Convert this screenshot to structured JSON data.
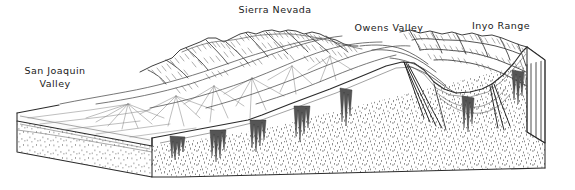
{
  "figure": {
    "type": "geologic-block-diagram",
    "width": 575,
    "height": 190
  },
  "labels": [
    {
      "id": "san-joaquin-valley",
      "name": "San Joaquin Valley",
      "line1": "San Joaquin",
      "line2": "Valley",
      "x": 17,
      "y": 65
    },
    {
      "id": "sierra-nevada",
      "name": "Sierra Nevada",
      "line1": "Sierra Nevada",
      "line2": "",
      "x": 224,
      "y": 4
    },
    {
      "id": "owens-valley",
      "name": "Owens Valley",
      "line1": "Owens Valley",
      "line2": "",
      "x": 353,
      "y": 22
    },
    {
      "id": "inyo-range",
      "name": "Inyo Range",
      "line1": "Inyo  Range",
      "line2": "",
      "x": 466,
      "y": 20
    }
  ],
  "colors": {
    "background": "#ffffff",
    "ink": "#2b2b2b",
    "ink_light": "#6f6f6f",
    "ink_faint": "#9a9a9a",
    "stipple": "#7a7a7a",
    "label_text": "#1a1a1a"
  },
  "features": {
    "top_surface": "Sloping map-view surface with alluvial fans, drainage lines and hachured mountain ridges",
    "front_face": "Stippled cross-section with vertical dike/pluton bodies",
    "right_end_face": "Vertically hatched cross-section panel",
    "left_end_face": "Two-layer edge: thin light upper bed over thick stippled basement",
    "fault_lines": "Steeply dipping normal faults descending beneath Owens Valley and the Inyo Range front"
  }
}
